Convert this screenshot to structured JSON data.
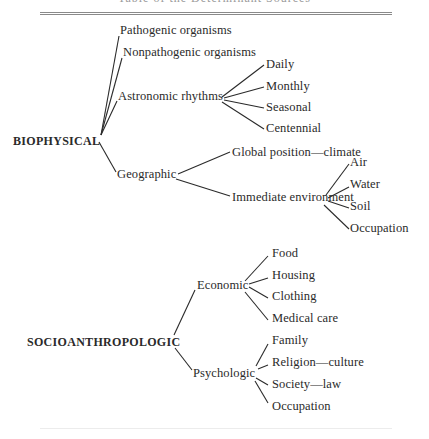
{
  "header": {
    "title": "Table of the Determinant Sources",
    "title_cut_off": true
  },
  "diagram": {
    "type": "tree",
    "roots": [
      {
        "label": "BIOPHYSICAL",
        "children": [
          {
            "label": "Pathogenic organisms"
          },
          {
            "label": "Nonpathogenic organisms"
          },
          {
            "label": "Astronomic rhythms",
            "children": [
              {
                "label": "Daily"
              },
              {
                "label": "Monthly"
              },
              {
                "label": "Seasonal"
              },
              {
                "label": "Centennial"
              }
            ]
          },
          {
            "label": "Geographic",
            "children": [
              {
                "label": "Global position—climate"
              },
              {
                "label": "Immediate environment",
                "children": [
                  {
                    "label": "Air"
                  },
                  {
                    "label": "Water"
                  },
                  {
                    "label": "Soil"
                  },
                  {
                    "label": "Occupation"
                  }
                ]
              }
            ]
          }
        ]
      },
      {
        "label": "SOCIOANTHROPOLOGIC",
        "children": [
          {
            "label": "Economic",
            "children": [
              {
                "label": "Food"
              },
              {
                "label": "Housing"
              },
              {
                "label": "Clothing"
              },
              {
                "label": "Medical care"
              }
            ]
          },
          {
            "label": "Psychologic",
            "children": [
              {
                "label": "Family"
              },
              {
                "label": "Religion—culture"
              },
              {
                "label": "Society—law"
              },
              {
                "label": "Occupation"
              }
            ]
          }
        ]
      }
    ]
  },
  "colors": {
    "ink": "#2a2a2a",
    "rule": "#8a8a8a",
    "background": "#ffffff"
  }
}
